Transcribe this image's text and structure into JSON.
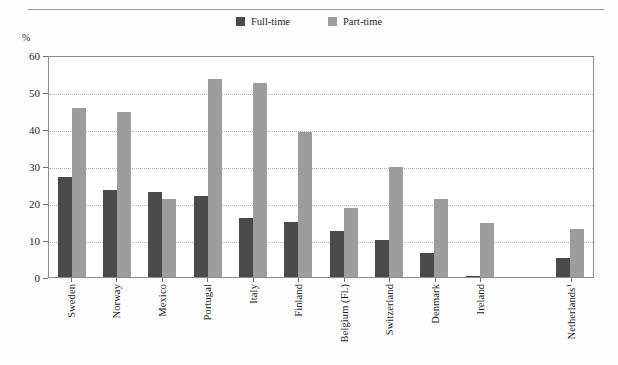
{
  "page": {
    "cutoff_text": "",
    "percent_symbol": "%"
  },
  "legend": {
    "items": [
      {
        "label": "Full-time",
        "color": "#4a4a4a",
        "icon": "square-swatch"
      },
      {
        "label": "Part-time",
        "color": "#9d9d9d",
        "icon": "square-swatch"
      }
    ]
  },
  "axis": {
    "y_ticks": [
      "60",
      "50",
      "40",
      "30",
      "20",
      "10",
      "0"
    ]
  },
  "chart_data": {
    "type": "bar",
    "title": "",
    "xlabel": "",
    "ylabel": "%",
    "ylim": [
      0,
      60
    ],
    "ytick_step": 10,
    "grid": true,
    "legend_position": "top-center",
    "categories": [
      "Sweden",
      "Norway",
      "Mexico",
      "Portugal",
      "Italy",
      "Finland",
      "Belgium (Fl.)",
      "Switzerland",
      "Denmark",
      "Ireland",
      "",
      "Netherlands¹"
    ],
    "series": [
      {
        "name": "Full-time",
        "color": "#4a4a4a",
        "values": [
          27.0,
          23.5,
          23.0,
          21.8,
          16.0,
          15.0,
          12.5,
          10.0,
          6.5,
          0.3,
          null,
          5.2
        ]
      },
      {
        "name": "Part-time",
        "color": "#9d9d9d",
        "values": [
          45.8,
          44.5,
          21.0,
          53.5,
          52.5,
          39.3,
          18.7,
          29.8,
          21.2,
          14.5,
          null,
          13.0
        ]
      }
    ]
  }
}
